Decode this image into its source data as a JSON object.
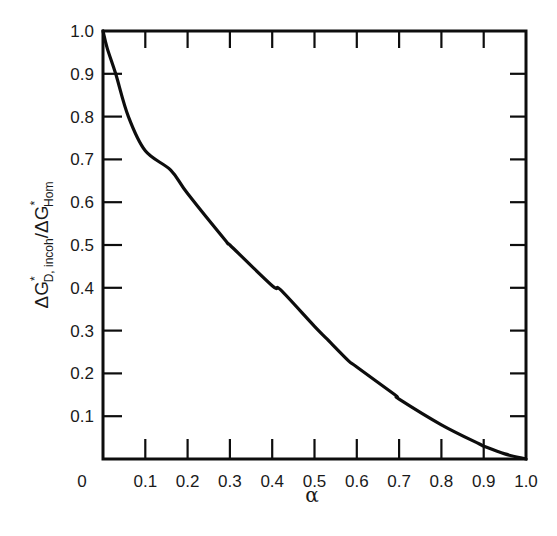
{
  "chart_data": {
    "type": "line",
    "title": "",
    "xlabel": "α",
    "ylabel": "ΔG*_{D, incoh}/ΔG*_{Hom}",
    "ylabel_parts": {
      "main1": "ΔG",
      "sup1": "*",
      "sub1": "D, incoh",
      "slash": "/ΔG",
      "sup2": "*",
      "sub2": "Hom"
    },
    "xlim": [
      0,
      1.0
    ],
    "ylim": [
      0,
      1.0
    ],
    "grid": false,
    "legend": null,
    "x_ticks": [
      "0",
      "0.1",
      "0.2",
      "0.3",
      "0.4",
      "0.5",
      "0.6",
      "0.7",
      "0.8",
      "0.9",
      "1.0"
    ],
    "y_ticks": [
      "0.1",
      "0.2",
      "0.3",
      "0.4",
      "0.5",
      "0.6",
      "0.7",
      "0.8",
      "0.9",
      "1.0"
    ],
    "series": [
      {
        "name": "ΔG*_{D,incoh}/ΔG*_{Hom}",
        "x": [
          0.0,
          0.01,
          0.03,
          0.06,
          0.1,
          0.16,
          0.2,
          0.29,
          0.3,
          0.4,
          0.42,
          0.5,
          0.53,
          0.58,
          0.6,
          0.69,
          0.7,
          0.8,
          0.89,
          0.9,
          0.95,
          1.0
        ],
        "y": [
          1.0,
          0.96,
          0.9,
          0.8,
          0.72,
          0.675,
          0.62,
          0.51,
          0.5,
          0.405,
          0.395,
          0.31,
          0.28,
          0.23,
          0.215,
          0.15,
          0.14,
          0.08,
          0.035,
          0.03,
          0.012,
          0.0
        ]
      }
    ]
  },
  "axes": {
    "x_label": "α",
    "origin_label": "0"
  }
}
